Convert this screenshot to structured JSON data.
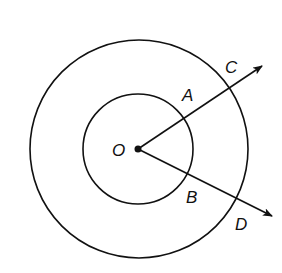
{
  "diagram": {
    "type": "concentric-circles-with-rays",
    "center": {
      "label": "O",
      "x": 138,
      "y": 149
    },
    "circles": [
      {
        "name": "inner",
        "r": 55
      },
      {
        "name": "outer",
        "r": 109
      }
    ],
    "rays": [
      {
        "name": "ray-OC",
        "through_inner": "A",
        "through_outer": "C",
        "end": {
          "x": 262,
          "y": 66
        }
      },
      {
        "name": "ray-OD",
        "through_inner": "B",
        "through_outer": "D",
        "end": {
          "x": 272,
          "y": 216
        }
      }
    ],
    "labels": {
      "O": "O",
      "A": "A",
      "B": "B",
      "C": "C",
      "D": "D"
    },
    "stroke_color": "#111111",
    "background_color": "#ffffff"
  }
}
